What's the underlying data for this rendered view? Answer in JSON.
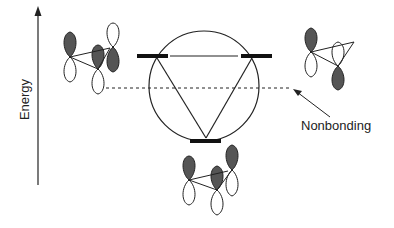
{
  "diagram": {
    "type": "frost-circle-molecular-orbital-diagram",
    "axis": {
      "label": "Energy",
      "direction": "up"
    },
    "annotation": {
      "label": "Nonbonding"
    },
    "levels": [
      {
        "name": "bonding",
        "count": 1
      },
      {
        "name": "antibonding-degenerate",
        "count": 2
      }
    ],
    "reference_line": "nonbonding (dashed)",
    "colors": {
      "ink": "#222222",
      "lobe_fill": "#555555",
      "bar": "#111111"
    }
  }
}
